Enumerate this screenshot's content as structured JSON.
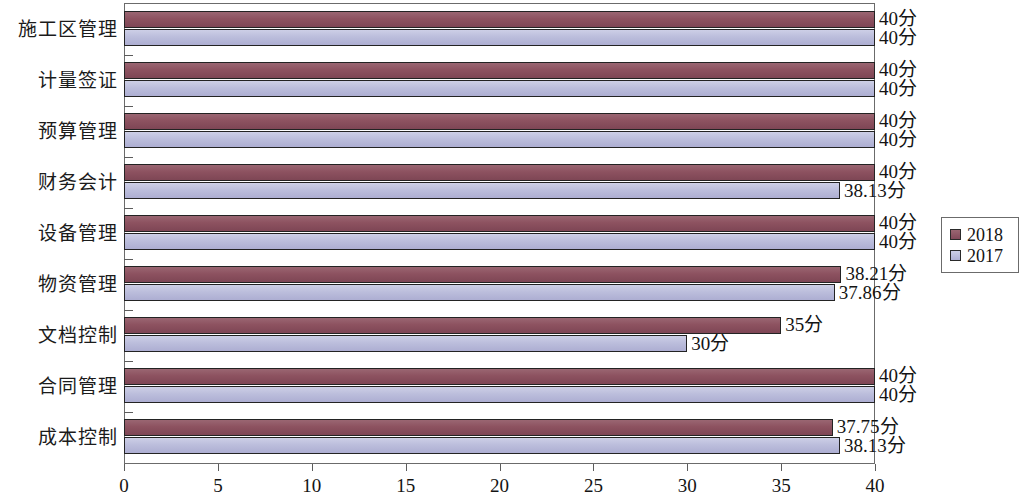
{
  "chart_data": {
    "type": "bar",
    "orientation": "horizontal",
    "title": "",
    "xlabel": "",
    "ylabel": "",
    "xlim": [
      0,
      40
    ],
    "xticks": [
      0,
      5,
      10,
      15,
      20,
      25,
      30,
      35,
      40
    ],
    "xtick_labels": [
      "0",
      "5",
      "10",
      "15",
      "20",
      "25",
      "30",
      "35",
      "40"
    ],
    "grid": false,
    "legend_position": "right",
    "unit_suffix": "分",
    "categories": [
      "施工区管理",
      "计量签证",
      "预算管理",
      "财务会计",
      "设备管理",
      "物资管理",
      "文档控制",
      "合同管理",
      "成本控制"
    ],
    "series": [
      {
        "name": "2018",
        "color": "#8d5260",
        "values": [
          40,
          40,
          40,
          40,
          40,
          38.21,
          35,
          40,
          37.75
        ],
        "labels": [
          "40分",
          "40分",
          "40分",
          "40分",
          "40分",
          "38.21分",
          "35分",
          "40分",
          "37.75分"
        ]
      },
      {
        "name": "2017",
        "color": "#bcbedc",
        "values": [
          40,
          40,
          40,
          38.13,
          40,
          37.86,
          30,
          40,
          38.13
        ],
        "labels": [
          "40分",
          "40分",
          "40分",
          "38.13分",
          "40分",
          "37.86分",
          "30分",
          "40分",
          "38.13分"
        ]
      }
    ]
  },
  "legend": {
    "items": [
      {
        "label": "2018",
        "swatch": "s2018"
      },
      {
        "label": "2017",
        "swatch": "s2017"
      }
    ]
  }
}
